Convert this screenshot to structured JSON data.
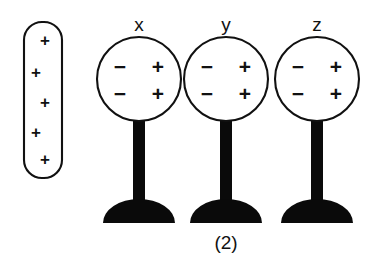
{
  "figure": {
    "caption": "(2)",
    "background_color": "#ffffff",
    "ink_color": "#111111",
    "solid_color": "#0a0a0a"
  },
  "charged_rod": {
    "name": "charged-rod",
    "shape": "rounded-capsule",
    "charge_symbol": "+",
    "charge_count": 5,
    "charges": [
      {
        "symbol": "+",
        "x": 45,
        "y": 42
      },
      {
        "symbol": "+",
        "x": 36,
        "y": 74
      },
      {
        "symbol": "+",
        "x": 45,
        "y": 104
      },
      {
        "symbol": "+",
        "x": 36,
        "y": 134
      },
      {
        "symbol": "+",
        "x": 45,
        "y": 161
      }
    ],
    "bounds": {
      "x": 24,
      "y": 22,
      "width": 38,
      "height": 156,
      "radius": 18
    }
  },
  "electroscopes": [
    {
      "label": "x",
      "label_x": 139,
      "label_y": 31,
      "sphere": {
        "cx": 139,
        "cy": 79,
        "r": 42
      },
      "charges": [
        {
          "symbol": "−",
          "x": 120,
          "y": 68
        },
        {
          "symbol": "+",
          "x": 158,
          "y": 68
        },
        {
          "symbol": "−",
          "x": 120,
          "y": 95
        },
        {
          "symbol": "+",
          "x": 158,
          "y": 95
        }
      ],
      "post": {
        "x": 133,
        "y": 118,
        "width": 12,
        "height": 86
      },
      "base": {
        "cx": 139,
        "cy": 223,
        "rx": 36,
        "ry": 24
      }
    },
    {
      "label": "y",
      "label_x": 226,
      "label_y": 31,
      "sphere": {
        "cx": 226,
        "cy": 79,
        "r": 42
      },
      "charges": [
        {
          "symbol": "−",
          "x": 207,
          "y": 68
        },
        {
          "symbol": "+",
          "x": 245,
          "y": 68
        },
        {
          "symbol": "−",
          "x": 207,
          "y": 95
        },
        {
          "symbol": "+",
          "x": 245,
          "y": 95
        }
      ],
      "post": {
        "x": 220,
        "y": 118,
        "width": 12,
        "height": 86
      },
      "base": {
        "cx": 226,
        "cy": 223,
        "rx": 36,
        "ry": 24
      }
    },
    {
      "label": "z",
      "label_x": 317,
      "label_y": 31,
      "sphere": {
        "cx": 317,
        "cy": 79,
        "r": 42
      },
      "charges": [
        {
          "symbol": "−",
          "x": 298,
          "y": 68
        },
        {
          "symbol": "+",
          "x": 336,
          "y": 68
        },
        {
          "symbol": "−",
          "x": 298,
          "y": 95
        },
        {
          "symbol": "+",
          "x": 336,
          "y": 95
        }
      ],
      "post": {
        "x": 311,
        "y": 118,
        "width": 12,
        "height": 86
      },
      "base": {
        "cx": 317,
        "cy": 223,
        "rx": 36,
        "ry": 24
      }
    }
  ],
  "caption_position": {
    "x": 226,
    "y": 249
  }
}
